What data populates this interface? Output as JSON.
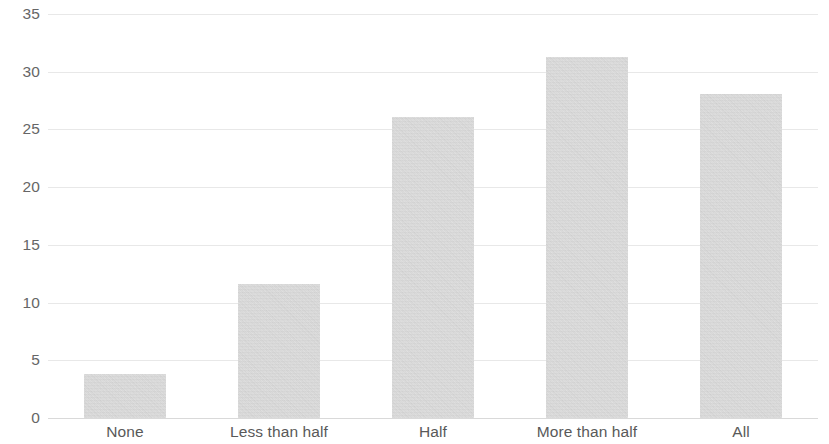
{
  "chart_data": {
    "type": "bar",
    "title": "",
    "subtitle": "",
    "xlabel": "",
    "ylabel": "",
    "categories": [
      "None",
      "Less than half",
      "Half",
      "More than half",
      "All"
    ],
    "values": [
      3.8,
      11.6,
      26.1,
      31.3,
      28.1
    ],
    "series": [
      {
        "name": "",
        "values": [
          3.8,
          11.6,
          26.1,
          31.3,
          28.1
        ]
      }
    ],
    "ylim": [
      0,
      35
    ],
    "xlim": [
      0,
      5
    ],
    "y_ticks": [
      0,
      5,
      10,
      15,
      20,
      25,
      30,
      35
    ],
    "y_tick_labels": [
      "0",
      "5",
      "10",
      "15",
      "20",
      "25",
      "30",
      "35"
    ],
    "x_tick_labels": [
      "None",
      "Less than half",
      "Half",
      "More than half",
      "All"
    ],
    "grid": "horizontal",
    "legend": "none",
    "legend_entries": [],
    "annotations": [],
    "bar_color": "#d2d2d2",
    "gridline_color": "#e8e8e8",
    "axis_color": "#d9d9d9",
    "tick_label_color": "#666666",
    "category_label_color": "#595959",
    "bar_width_ratio": 0.53
  }
}
